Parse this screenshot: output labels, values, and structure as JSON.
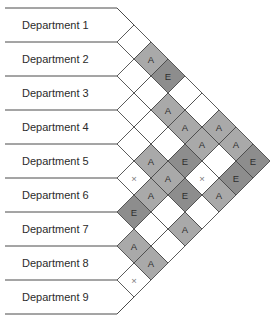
{
  "diagram": {
    "type": "relationship-chart",
    "departments": [
      "Department 1",
      "Department 2",
      "Department 3",
      "Department 4",
      "Department 5",
      "Department 6",
      "Department 7",
      "Department 8",
      "Department 9"
    ],
    "relationships": [
      [
        "",
        "A",
        "E",
        "",
        "",
        "A",
        "A",
        "E"
      ],
      [
        "",
        "",
        "A",
        "A",
        "A",
        "",
        "E"
      ],
      [
        "",
        "",
        "",
        "E",
        "X",
        "A"
      ],
      [
        "",
        "A",
        "A",
        "E",
        ""
      ],
      [
        "X",
        "A",
        "",
        "A"
      ],
      [
        "E",
        "",
        ""
      ],
      [
        "A",
        "A"
      ],
      [
        "X"
      ]
    ],
    "relationships_note": "relationships[i][k] is the code for pair (Department i+1, Department i+2+k)",
    "colors": {
      "A": "#a9a9a9",
      "E": "#8d8d8d",
      "X": "#ffffff",
      "blank": "#ffffff",
      "outline": "#4a4a4a"
    }
  }
}
